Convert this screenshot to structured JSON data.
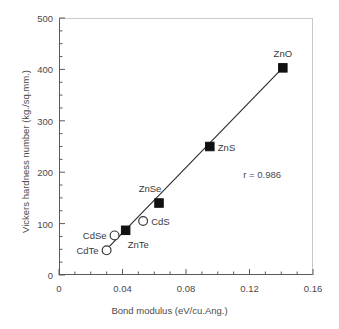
{
  "chart_data": {
    "type": "scatter",
    "title": "",
    "xlabel": "Bond modulus (eV/cu.Ang.)",
    "ylabel": "Vickers hardness number (kg./sq.mm.)",
    "xlim": [
      0,
      0.16
    ],
    "ylim": [
      0,
      500
    ],
    "xticks": [
      "0",
      "0.04",
      "0.08",
      "0.12",
      "0.16"
    ],
    "xtick_values": [
      0,
      0.04,
      0.08,
      0.12,
      0.16
    ],
    "yticks": [
      "0",
      "100",
      "200",
      "300",
      "400",
      "500"
    ],
    "ytick_values": [
      0,
      100,
      200,
      300,
      400,
      500
    ],
    "x_minor_step": 0.01,
    "y_minor_step": 25,
    "grid": false,
    "legend": false,
    "annotations": [
      {
        "text": "r = 0.986",
        "x": 0.128,
        "y": 196
      }
    ],
    "series": [
      {
        "name": "zinc compounds",
        "marker": "filled-square",
        "points": [
          {
            "label": "ZnTe",
            "x": 0.042,
            "y": 87,
            "label_pos": "below-right"
          },
          {
            "label": "ZnSe",
            "x": 0.063,
            "y": 140,
            "label_pos": "above-left"
          },
          {
            "label": "ZnS",
            "x": 0.095,
            "y": 250,
            "label_pos": "right"
          },
          {
            "label": "ZnO",
            "x": 0.141,
            "y": 403,
            "label_pos": "above"
          }
        ]
      },
      {
        "name": "cadmium compounds",
        "marker": "open-circle",
        "points": [
          {
            "label": "CdTe",
            "x": 0.03,
            "y": 48,
            "label_pos": "left"
          },
          {
            "label": "CdSe",
            "x": 0.035,
            "y": 77,
            "label_pos": "left"
          },
          {
            "label": "CdS",
            "x": 0.053,
            "y": 105,
            "label_pos": "right"
          }
        ]
      }
    ],
    "fit_line": {
      "name": "regression-line",
      "x_start": 0.0275,
      "y_start": 42,
      "x_end": 0.1415,
      "y_end": 405
    }
  }
}
